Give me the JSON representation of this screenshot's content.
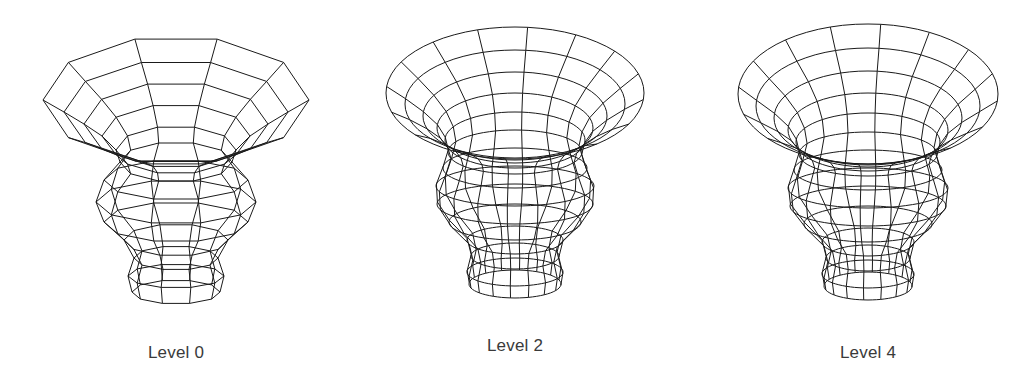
{
  "figures": [
    {
      "id": "level-0",
      "label": "Level 0",
      "center_x": 176,
      "label_y": 343,
      "style": "polygonal",
      "segments": 10,
      "profile": [
        {
          "y": 100,
          "rx": 133,
          "ry": 64
        },
        {
          "y": 112,
          "rx": 112,
          "ry": 52
        },
        {
          "y": 124,
          "rx": 92,
          "ry": 42
        },
        {
          "y": 136,
          "rx": 74,
          "ry": 32
        },
        {
          "y": 150,
          "rx": 60,
          "ry": 24
        },
        {
          "y": 162,
          "rx": 56,
          "ry": 20
        },
        {
          "y": 180,
          "rx": 72,
          "ry": 20
        },
        {
          "y": 202,
          "rx": 80,
          "ry": 22
        },
        {
          "y": 222,
          "rx": 72,
          "ry": 20
        },
        {
          "y": 240,
          "rx": 52,
          "ry": 16
        },
        {
          "y": 258,
          "rx": 42,
          "ry": 12
        },
        {
          "y": 276,
          "rx": 48,
          "ry": 12
        },
        {
          "y": 292,
          "rx": 44,
          "ry": 12
        }
      ]
    },
    {
      "id": "level-2",
      "label": "Level 2",
      "center_x": 515,
      "label_y": 336,
      "style": "smooth",
      "segments": 16,
      "profile": [
        {
          "y": 93,
          "rx": 129,
          "ry": 66
        },
        {
          "y": 104,
          "rx": 110,
          "ry": 54
        },
        {
          "y": 116,
          "rx": 92,
          "ry": 44
        },
        {
          "y": 128,
          "rx": 78,
          "ry": 35
        },
        {
          "y": 140,
          "rx": 70,
          "ry": 28
        },
        {
          "y": 152,
          "rx": 67,
          "ry": 22
        },
        {
          "y": 168,
          "rx": 72,
          "ry": 20
        },
        {
          "y": 186,
          "rx": 79,
          "ry": 20
        },
        {
          "y": 204,
          "rx": 78,
          "ry": 20
        },
        {
          "y": 222,
          "rx": 66,
          "ry": 18
        },
        {
          "y": 240,
          "rx": 48,
          "ry": 14
        },
        {
          "y": 256,
          "rx": 44,
          "ry": 13
        },
        {
          "y": 272,
          "rx": 48,
          "ry": 14
        },
        {
          "y": 284,
          "rx": 46,
          "ry": 14
        }
      ]
    },
    {
      "id": "level-4",
      "label": "Level 4",
      "center_x": 868,
      "label_y": 343,
      "style": "smooth",
      "segments": 16,
      "profile": [
        {
          "y": 94,
          "rx": 130,
          "ry": 70
        },
        {
          "y": 106,
          "rx": 112,
          "ry": 58
        },
        {
          "y": 118,
          "rx": 94,
          "ry": 47
        },
        {
          "y": 130,
          "rx": 80,
          "ry": 37
        },
        {
          "y": 142,
          "rx": 72,
          "ry": 29
        },
        {
          "y": 154,
          "rx": 69,
          "ry": 22
        },
        {
          "y": 170,
          "rx": 74,
          "ry": 20
        },
        {
          "y": 188,
          "rx": 80,
          "ry": 20
        },
        {
          "y": 206,
          "rx": 78,
          "ry": 20
        },
        {
          "y": 224,
          "rx": 64,
          "ry": 18
        },
        {
          "y": 242,
          "rx": 46,
          "ry": 14
        },
        {
          "y": 258,
          "rx": 42,
          "ry": 13
        },
        {
          "y": 274,
          "rx": 46,
          "ry": 14
        },
        {
          "y": 286,
          "rx": 44,
          "ry": 14
        }
      ]
    }
  ],
  "stroke_color": "#1a1a1a",
  "label_color": "#3a3a3a"
}
